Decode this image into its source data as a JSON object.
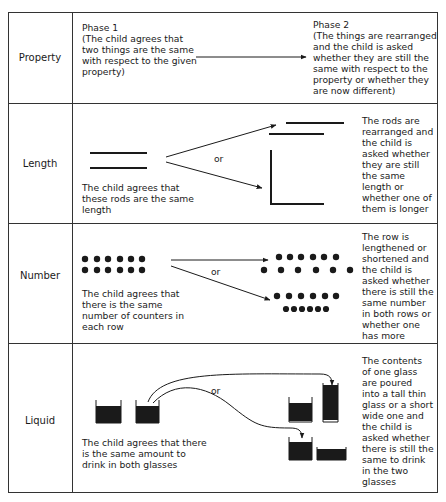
{
  "rows": [
    {
      "property": "Property",
      "phase1": "Phase 1\n(The child agrees that\ntwo things are the same\nwith respect to the given\nproperty)",
      "phase2": "Phase 2\n(The things are rearranged\nand the child is asked\nwhether they are still the\nsame with respect to the\nproperty or whether they\nare now different)"
    },
    {
      "property": "Length",
      "phase1": "The child agrees that\nthese rods are the same\nlength",
      "connector": "or",
      "phase2": "The rods are\nrearranged and\nthe child is\nasked whether\nthey are still\nthe same\nlength or\nwhether one of\nthem is longer"
    },
    {
      "property": "Number",
      "phase1": "The child agrees that\nthere is the same\nnumber of counters in\neach row",
      "connector": "or",
      "phase2": "The row is\nlengthened or\nshortened and\nthe child is\nasked whether\nthere is still the\nsame number\nin both rows or\nwhether one\nhas more"
    },
    {
      "property": "Liquid",
      "phase1": "The child agrees that there\nis the same amount to\ndrink in both glasses",
      "connector": "or",
      "phase2": "The contents\nof one glass\nare poured\ninto a tall thin\nglass or a short\nwide one and\nthe child is\nasked whether\nthere is still the\nsame to drink\nin the two\nglasses"
    }
  ],
  "colors": {
    "ink": "#1a1a1a",
    "border": "#333333",
    "background": "#ffffff"
  }
}
